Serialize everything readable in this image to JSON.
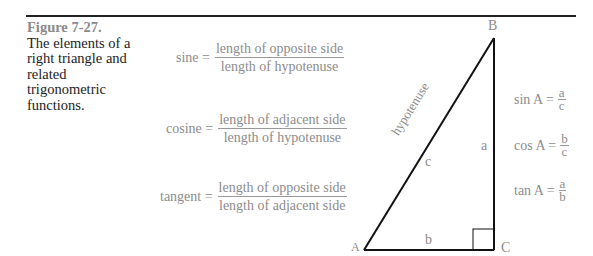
{
  "caption": {
    "figure_number": "Figure 7-27.",
    "text": "The elements of a right triangle and related trigonometric functions."
  },
  "definitions": [
    {
      "name": "sine =",
      "numerator": "length of opposite side",
      "denominator": "length of hypotenuse"
    },
    {
      "name": "cosine =",
      "numerator": "length of adjacent side",
      "denominator": "length of hypotenuse"
    },
    {
      "name": "tangent =",
      "numerator": "length of opposite side",
      "denominator": "length of adjacent side"
    }
  ],
  "triangle": {
    "vertices": {
      "A": "A",
      "B": "B",
      "C": "C"
    },
    "sides": {
      "a": "a",
      "b": "b",
      "c": "c"
    },
    "hypotenuse_label": "hypotenuse"
  },
  "ratios": [
    {
      "name": "sin A =",
      "numerator": "a",
      "denominator": "c"
    },
    {
      "name": "cos A =",
      "numerator": "b",
      "denominator": "c"
    },
    {
      "name": "tan A =",
      "numerator": "a",
      "denominator": "b"
    }
  ],
  "colors": {
    "rule": "#222222",
    "figure_label": "#8a8a8a",
    "formula_text": "#8c8c8c",
    "lines": "#111111"
  }
}
